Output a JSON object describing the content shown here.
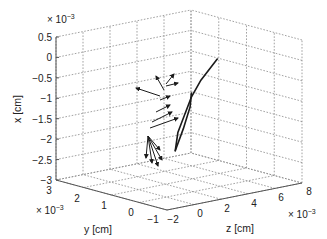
{
  "chart_data": {
    "type": "line3d",
    "title": "",
    "xlabel": "x [cm]",
    "ylabel": "y [cm]",
    "zlabel": "z [cm]",
    "x_axis": {
      "range": [
        -0.003,
        0.0005
      ],
      "ticks": [
        "0.5",
        "0",
        "−0.5",
        "−1",
        "−1.5",
        "−2",
        "−2.5",
        "−3"
      ],
      "tick_values": [
        0.5,
        0,
        -0.5,
        -1,
        -1.5,
        -2,
        -2.5,
        -3
      ],
      "exponent": "× 10⁻³"
    },
    "y_axis": {
      "range": [
        -0.001,
        0.003
      ],
      "ticks": [
        "3",
        "2",
        "1",
        "0",
        "−1"
      ],
      "tick_values": [
        3,
        2,
        1,
        0,
        -1
      ],
      "exponent": "× 10⁻³"
    },
    "z_axis": {
      "range": [
        -0.002,
        0.008
      ],
      "ticks": [
        "−2",
        "0",
        "2",
        "4",
        "6",
        "8"
      ],
      "tick_values": [
        -2,
        0,
        2,
        4,
        6,
        8
      ],
      "exponent": "× 10⁻³"
    },
    "grid": true,
    "legend": null,
    "series": [
      {
        "name": "trajectory",
        "units": "1e-3 cm",
        "points_xyz": [
          [
            -2.1,
            0.6,
            1.9
          ],
          [
            -1.7,
            0.7,
            2.3
          ],
          [
            -1.3,
            0.7,
            2.8
          ],
          [
            -0.9,
            0.7,
            3.3
          ],
          [
            -0.5,
            0.6,
            3.8
          ],
          [
            0.0,
            0.4,
            4.6
          ]
        ]
      },
      {
        "name": "second trajectory",
        "units": "1e-3 cm",
        "points_xyz": [
          [
            -2.1,
            0.6,
            1.9
          ],
          [
            -1.6,
            0.6,
            2.5
          ],
          [
            -1.1,
            0.6,
            3.0
          ],
          [
            -0.8,
            0.7,
            3.3
          ]
        ]
      }
    ],
    "vectors": [
      {
        "origin_screen": [
          148,
          136
        ],
        "tip_screen": [
          146,
          158
        ]
      },
      {
        "origin_screen": [
          148,
          136
        ],
        "tip_screen": [
          152,
          163
        ]
      },
      {
        "origin_screen": [
          148,
          136
        ],
        "tip_screen": [
          158,
          166
        ]
      },
      {
        "origin_screen": [
          148,
          136
        ],
        "tip_screen": [
          162,
          160
        ]
      },
      {
        "origin_screen": [
          148,
          136
        ],
        "tip_screen": [
          160,
          150
        ]
      },
      {
        "origin_screen": [
          150,
          128
        ],
        "tip_screen": [
          178,
          118
        ]
      },
      {
        "origin_screen": [
          152,
          122
        ],
        "tip_screen": [
          172,
          112
        ]
      },
      {
        "origin_screen": [
          156,
          112
        ],
        "tip_screen": [
          170,
          105
        ]
      },
      {
        "origin_screen": [
          160,
          100
        ],
        "tip_screen": [
          170,
          96
        ]
      },
      {
        "origin_screen": [
          160,
          96
        ],
        "tip_screen": [
          136,
          88
        ]
      },
      {
        "origin_screen": [
          164,
          90
        ],
        "tip_screen": [
          156,
          76
        ]
      },
      {
        "origin_screen": [
          166,
          86
        ],
        "tip_screen": [
          178,
          83
        ]
      },
      {
        "origin_screen": [
          166,
          84
        ],
        "tip_screen": [
          174,
          74
        ]
      }
    ]
  },
  "labels": {
    "x_exponent": "× 10",
    "x_exp_sup": "−3",
    "y_exponent": "× 10",
    "y_exp_sup": "−3",
    "z_exponent": "× 10",
    "z_exp_sup": "−3",
    "xlabel": "x [cm]",
    "ylabel": "y [cm]",
    "zlabel": "z [cm]"
  },
  "ticks": {
    "x": [
      "0.5",
      "0",
      "−0.5",
      "−1",
      "−1.5",
      "−2",
      "−2.5",
      "−3"
    ],
    "y": [
      "3",
      "2",
      "1",
      "0",
      "−1"
    ],
    "z": [
      "−2",
      "0",
      "2",
      "4",
      "6",
      "8"
    ]
  }
}
